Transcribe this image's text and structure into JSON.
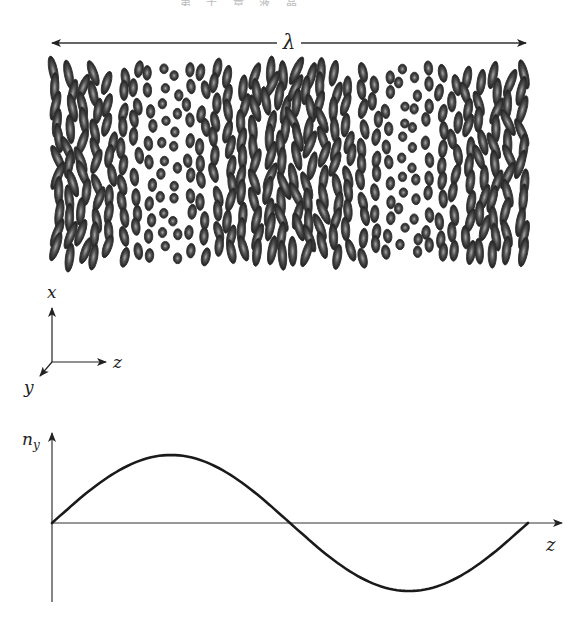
{
  "figure": {
    "header_fragment": "第 十 章   液 晶",
    "wavelength_arrow": {
      "label": "λ",
      "x_start": 52,
      "x_end": 526,
      "y": 43
    },
    "director_field": {
      "x_start": 50,
      "x_end": 528,
      "y_top": 66,
      "y_bottom": 264,
      "columns": 36,
      "rows": 11,
      "pitch_px": 476,
      "long_axis_px": 15,
      "short_axis_px": 4.2,
      "fill_color": "#333333",
      "highlight_color": "#9a9a9a"
    },
    "coordinate_triad": {
      "origin": [
        52,
        362
      ],
      "axes": [
        {
          "name": "x",
          "label": "x",
          "tip": [
            52,
            308
          ],
          "label_pos": [
            47,
            298
          ]
        },
        {
          "name": "z",
          "label": "z",
          "tip": [
            106,
            362
          ],
          "label_pos": [
            113,
            368
          ]
        },
        {
          "name": "y",
          "label": "y",
          "tip": [
            40,
            376
          ],
          "label_pos": [
            24,
            393
          ]
        }
      ]
    },
    "plot": {
      "y_axis_label": "n",
      "y_axis_subscript": "y",
      "x_axis_label": "z",
      "origin": [
        52,
        523
      ],
      "x_axis_end": 562,
      "y_axis_top": 433,
      "y_axis_bottom": 602,
      "curve_color": "#1a1a1a"
    }
  },
  "chart_data": {
    "type": "line",
    "title": "",
    "xlabel": "z",
    "ylabel": "n_y",
    "x": [
      0,
      0.125,
      0.25,
      0.375,
      0.5,
      0.625,
      0.75,
      0.875,
      1.0
    ],
    "series": [
      {
        "name": "n_y",
        "values": [
          0,
          0.707,
          1,
          0.707,
          0,
          -0.707,
          -1,
          -0.707,
          0
        ]
      }
    ],
    "x_units": "λ (one full pitch)",
    "ylim": [
      -1,
      1
    ],
    "grid": false,
    "annotations": [
      "λ spans one full period of the director field"
    ]
  }
}
